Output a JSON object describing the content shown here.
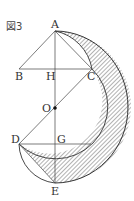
{
  "figure": {
    "title": "図3",
    "colors": {
      "stroke": "#333333",
      "hatch": "#555555",
      "background": "#ffffff"
    },
    "points": {
      "A": {
        "label": "A",
        "x": 55,
        "y": 31
      },
      "B": {
        "label": "B",
        "x": 19,
        "y": 69
      },
      "H": {
        "label": "H",
        "x": 55,
        "y": 69
      },
      "C": {
        "label": "C",
        "x": 92,
        "y": 69
      },
      "O": {
        "label": "O",
        "x": 55,
        "y": 108
      },
      "D": {
        "label": "D",
        "x": 19,
        "y": 144
      },
      "G": {
        "label": "G",
        "x": 55,
        "y": 144
      },
      "E": {
        "label": "E",
        "x": 55,
        "y": 183
      }
    },
    "segments": [
      "AB",
      "AE",
      "BC",
      "AC",
      "DC",
      "DG",
      "DE"
    ],
    "shaded_region": "crescent between outer semicircle on AE and inner arc C→D centered at O, plus regions near A and E"
  }
}
